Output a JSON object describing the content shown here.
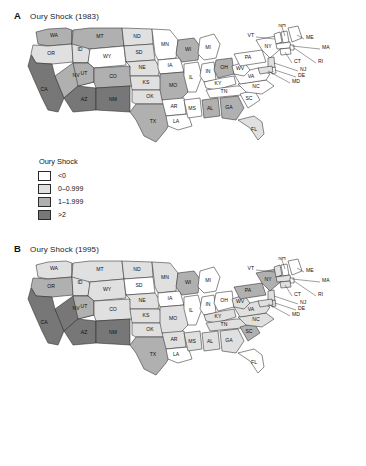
{
  "figure": {
    "panels": [
      {
        "letter": "A",
        "title": "Oury Shock (1983)",
        "legend": {
          "title": "Oury Shock",
          "items": [
            {
              "label": "<0",
              "color": "#ffffff"
            },
            {
              "label": "0–0.999",
              "color": "#e0e0e0"
            },
            {
              "label": "1–1.999",
              "color": "#b0b0b0"
            },
            {
              "label": ">2",
              "color": "#777777"
            }
          ]
        }
      },
      {
        "letter": "B",
        "title": "Oury Shock (1995)",
        "legend": {
          "title": "Oury Shock",
          "items": [
            {
              "label": "<0",
              "color": "#ffffff"
            },
            {
              "label": "0–0.999",
              "color": "#e0e0e0"
            },
            {
              "label": "1–1.999",
              "color": "#b0b0b0"
            },
            {
              "label": ">2",
              "color": "#777777"
            }
          ]
        }
      }
    ]
  },
  "chart_data": {
    "type": "map",
    "legend_title": "Oury Shock",
    "bins": [
      {
        "label": "<0",
        "color": "#ffffff",
        "min": null,
        "max": 0
      },
      {
        "label": "0–0.999",
        "color": "#e0e0e0",
        "min": 0,
        "max": 0.999
      },
      {
        "label": "1–1.999",
        "color": "#b0b0b0",
        "min": 1,
        "max": 1.999
      },
      {
        "label": ">2",
        "color": "#777777",
        "min": 2,
        "max": null
      }
    ],
    "maps": [
      {
        "panel": "A",
        "year": 1983,
        "title": "Oury Shock (1983)",
        "values": {
          "WA": "1–1.999",
          "OR": "0–0.999",
          "CA": ">2",
          "ID": "0–0.999",
          "NV": "1–1.999",
          "MT": "1–1.999",
          "WY": "<0",
          "UT": "1–1.999",
          "CO": "1–1.999",
          "AZ": ">2",
          "NM": ">2",
          "ND": "0–0.999",
          "SD": "0–0.999",
          "NE": "0–0.999",
          "KS": "0–0.999",
          "OK": "0–0.999",
          "TX": "1–1.999",
          "MN": "<0",
          "IA": "<0",
          "MO": "1–1.999",
          "AR": "<0",
          "LA": "<0",
          "WI": "1–1.999",
          "IL": "<0",
          "MI": "<0",
          "IN": "<0",
          "OH": "1–1.999",
          "KY": "<0",
          "TN": "<0",
          "MS": "<0",
          "AL": "1–1.999",
          "GA": "1–1.999",
          "FL": "0–0.999",
          "SC": "<0",
          "NC": "<0",
          "VA": "<0",
          "WV": "<0",
          "PA": "<0",
          "NY": "<0",
          "VT": "<0",
          "NH": "<0",
          "ME": "<0",
          "MA": "<0",
          "RI": "<0",
          "CT": "<0",
          "NJ": "0–0.999",
          "DE": "<0",
          "MD": "0–0.999"
        }
      },
      {
        "panel": "B",
        "year": 1995,
        "title": "Oury Shock (1995)",
        "values": {
          "WA": "0–0.999",
          "OR": "1–1.999",
          "CA": ">2",
          "ID": "0–0.999",
          "NV": ">2",
          "MT": "0–0.999",
          "WY": "0–0.999",
          "UT": "1–1.999",
          "CO": "0–0.999",
          "AZ": ">2",
          "NM": ">2",
          "ND": "0–0.999",
          "SD": "<0",
          "NE": "0–0.999",
          "KS": "0–0.999",
          "OK": "0–0.999",
          "TX": "1–1.999",
          "MN": "0–0.999",
          "IA": "<0",
          "MO": "0–0.999",
          "AR": "0–0.999",
          "LA": "<0",
          "WI": "1–1.999",
          "IL": "<0",
          "MI": "<0",
          "IN": "<0",
          "OH": "<0",
          "KY": "0–0.999",
          "TN": "0–0.999",
          "MS": "0–0.999",
          "AL": "0–0.999",
          "GA": "0–0.999",
          "FL": "<0",
          "SC": "1–1.999",
          "NC": "0–0.999",
          "VA": "0–0.999",
          "WV": "0–0.999",
          "PA": "1–1.999",
          "NY": "1–1.999",
          "VT": "0–0.999",
          "NH": "<0",
          "ME": "<0",
          "MA": "0–0.999",
          "RI": "<0",
          "CT": "0–0.999",
          "NJ": "0–0.999",
          "DE": "0–0.999",
          "MD": "0–0.999"
        }
      }
    ],
    "inline_labels": [
      "WA",
      "OR",
      "CA",
      "ID",
      "NV",
      "MT",
      "WY",
      "UT",
      "CO",
      "AZ",
      "NM",
      "ND",
      "SD",
      "NE",
      "KS",
      "OK",
      "TX",
      "MN",
      "IA",
      "MO",
      "AR",
      "LA",
      "WI",
      "IL",
      "MI",
      "IN",
      "OH",
      "KY",
      "TN",
      "MS",
      "AL",
      "GA",
      "FL",
      "SC",
      "NC",
      "VA",
      "WV",
      "PA",
      "NY"
    ],
    "leader_labels": [
      "VT",
      "NH",
      "ME",
      "MA",
      "RI",
      "CT",
      "NJ",
      "DE",
      "MD"
    ]
  }
}
